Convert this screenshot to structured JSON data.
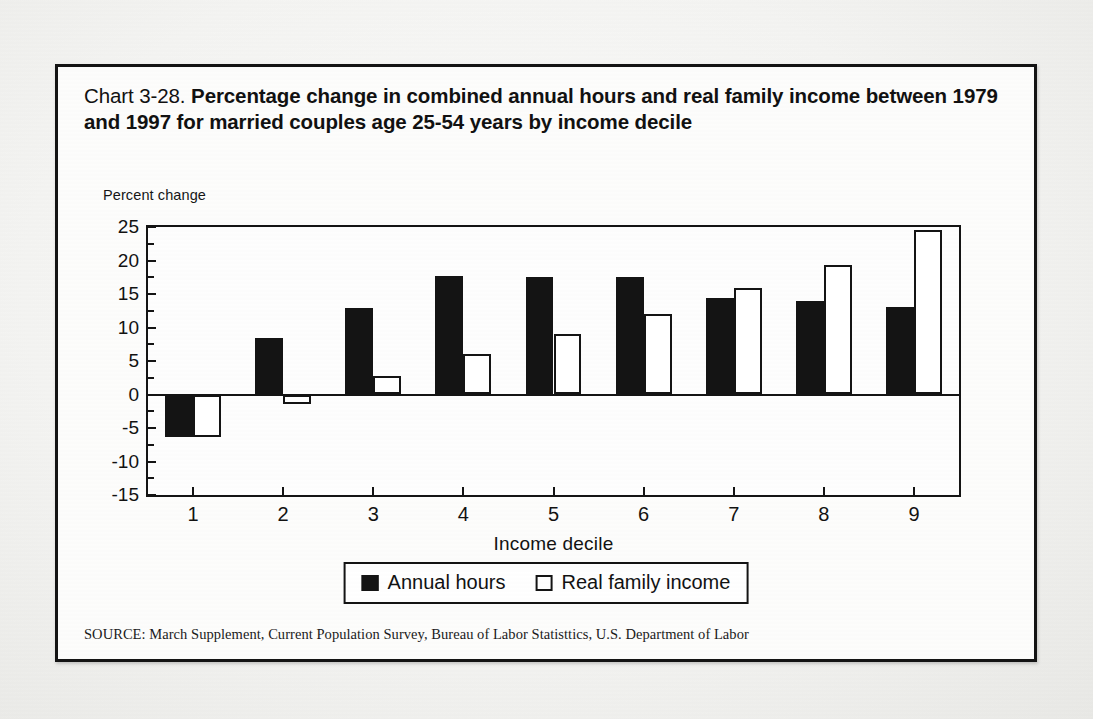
{
  "figure": {
    "title_lead": "Chart 3-28.",
    "title_bold": "Percentage change in combined annual hours and real family income between 1979 and 1997 for married couples age 25-54 years by income decile",
    "source": "SOURCE: March Supplement, Current Population Survey, Bureau of Labor Statisttics, U.S. Department of Labor"
  },
  "legend": {
    "hours_label": "Annual hours",
    "income_label": "Real family income"
  },
  "colors": {
    "hours": "#141414",
    "income": "#ffffff",
    "outline": "#141414",
    "page": "#f2f2f0"
  },
  "chart_data": {
    "type": "bar",
    "title": "Chart 3-28. Percentage change in combined annual hours and real family income between 1979 and 1997 for married couples age 25-54 years by income decile",
    "xlabel": "Income decile",
    "ylabel": "Percent change",
    "categories": [
      "1",
      "2",
      "3",
      "4",
      "5",
      "6",
      "7",
      "8",
      "9"
    ],
    "series": [
      {
        "name": "Annual hours",
        "values": [
          -6.3,
          8.4,
          12.9,
          17.7,
          17.6,
          17.5,
          14.4,
          14.0,
          13.0
        ]
      },
      {
        "name": "Real family income",
        "values": [
          -6.4,
          -1.4,
          2.7,
          6.0,
          9.0,
          12.0,
          15.9,
          19.3,
          24.5
        ]
      }
    ],
    "ylim": [
      -15,
      25
    ],
    "yticks": [
      25,
      20,
      15,
      10,
      5,
      0,
      -5,
      -10,
      -15
    ],
    "ytick_labels": [
      "25",
      "20",
      "15",
      "10",
      "5",
      "0",
      "-5",
      "-10",
      "-15"
    ],
    "grid": false,
    "legend_position": "bottom"
  }
}
